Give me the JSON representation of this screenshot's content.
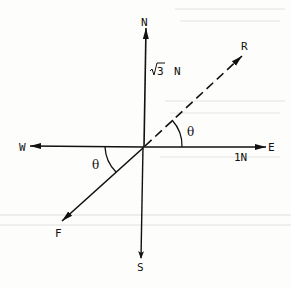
{
  "diagram": {
    "type": "force vector diagram",
    "colors": {
      "ink": "#111111",
      "background": "#fdfdfb"
    },
    "compass": {
      "north": "N",
      "south": "S",
      "east": "E",
      "west": "W"
    },
    "vectors": [
      {
        "name": "north-force",
        "direction": "N",
        "magnitude_label": "√3 N",
        "style": "solid"
      },
      {
        "name": "east-force",
        "direction": "E",
        "magnitude_label": "1N",
        "style": "solid"
      },
      {
        "name": "resultant",
        "label": "R",
        "style": "dashed",
        "angle_from_east": "θ"
      },
      {
        "name": "force-F",
        "label": "F",
        "style": "solid",
        "angle_from_west": "θ"
      }
    ],
    "labels": {
      "north_magnitude_radical": "√",
      "north_magnitude_value": "3",
      "north_magnitude_unit": "N",
      "east_magnitude": "1N",
      "resultant": "R",
      "force_f": "F",
      "theta_upper": "θ",
      "theta_lower": "θ"
    }
  }
}
